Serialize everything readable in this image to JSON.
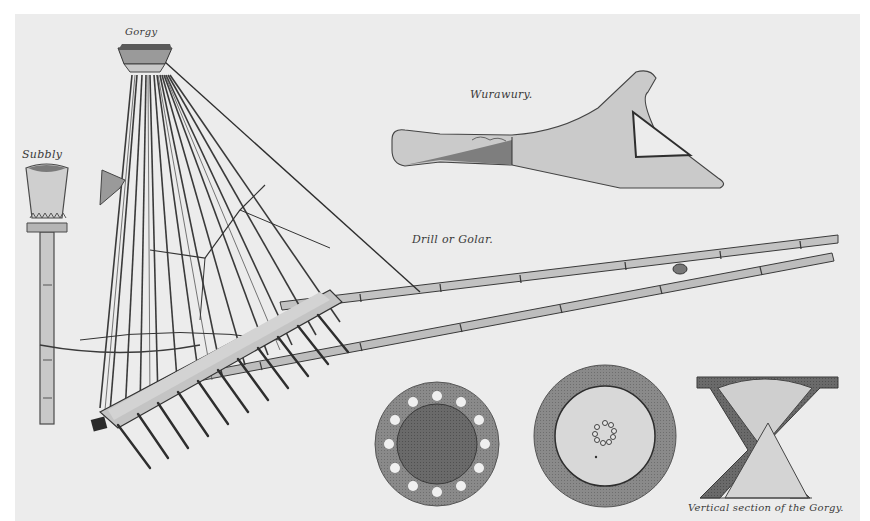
{
  "illustration": {
    "type": "engraved plate of agricultural implements",
    "background_color": "#ececec",
    "ink_color": "#2e2e2e",
    "wood_color": "#b8b8b8"
  },
  "labels": {
    "gorgy": "Gorgy",
    "subbly": "Subbly",
    "wurawury": "Wurawury.",
    "drill": "Drill or Golar.",
    "vertical_section": "Vertical section of the Gorgy."
  },
  "figures": [
    {
      "name": "Gorgy",
      "description": "seed drill hopper with bamboo seed tubes fanning to a coulter beam with tines"
    },
    {
      "name": "Subbly",
      "description": "small hopper cup mounted on a bamboo post"
    },
    {
      "name": "Wurawury",
      "description": "wooden plough share with handle and triangular opening"
    },
    {
      "name": "Drill or Golar",
      "description": "two long bamboo draught poles"
    },
    {
      "name": "Plan of Gorgy base",
      "description": "disc with ring of 12 holes"
    },
    {
      "name": "Plan of Gorgy top",
      "description": "disc with small central ring of holes"
    },
    {
      "name": "Vertical section of the Gorgy",
      "description": "hourglass shaped cross-section"
    }
  ]
}
